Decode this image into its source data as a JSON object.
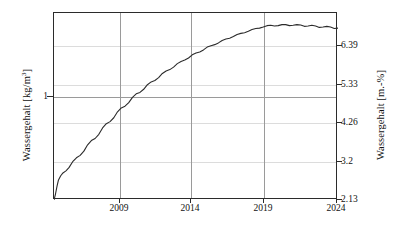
{
  "chart_data": {
    "type": "line",
    "title": "",
    "xlabel": "",
    "ylabel": "Wassergehalt [kg/m3]",
    "ylabel_right": "Wassergehalt [m.-%]",
    "xlim": [
      2005.0,
      2024.0
    ],
    "ylim_left": [
      0.0,
      2.0
    ],
    "ylim_right": [
      2.13,
      7.45
    ],
    "grid": true,
    "legend": null,
    "x_ticks": [
      2009,
      2014,
      2019,
      2024
    ],
    "x_tick_labels": [
      "2009",
      "2014",
      "2019",
      "2024"
    ],
    "y_ticks_left": [
      1
    ],
    "y_tick_labels_left": [
      "1"
    ],
    "y_ticks_right": [
      2.13,
      3.2,
      4.26,
      5.33,
      6.39
    ],
    "y_tick_labels_right": [
      "2.13",
      "3.2",
      "4.26",
      "5.33",
      "6.39"
    ],
    "series": [
      {
        "name": "Wassergehalt",
        "color": "#2b2b2b",
        "x": [
          2005.0,
          2005.1,
          2005.2,
          2005.3,
          2005.45,
          2005.6,
          2005.8,
          2006.0,
          2006.25,
          2006.5,
          2006.75,
          2007.0,
          2007.25,
          2007.5,
          2007.75,
          2008.0,
          2008.25,
          2008.5,
          2008.75,
          2009.0,
          2009.25,
          2009.5,
          2009.75,
          2010.0,
          2010.25,
          2010.5,
          2010.75,
          2011.0,
          2011.25,
          2011.5,
          2011.75,
          2012.0,
          2012.25,
          2012.5,
          2012.75,
          2013.0,
          2013.25,
          2013.5,
          2013.75,
          2014.0,
          2014.25,
          2014.5,
          2014.75,
          2015.0,
          2015.25,
          2015.5,
          2015.75,
          2016.0,
          2016.25,
          2016.5,
          2016.75,
          2017.0,
          2017.25,
          2017.5,
          2017.75,
          2018.0,
          2018.25,
          2018.5,
          2018.75,
          2019.0,
          2019.25,
          2019.5,
          2019.75,
          2020.0,
          2020.25,
          2020.5,
          2020.75,
          2021.0,
          2021.25,
          2021.5,
          2021.75,
          2022.0,
          2022.25,
          2022.5,
          2022.75,
          2023.0,
          2023.25,
          2023.5,
          2023.75,
          2024.0
        ],
        "y": [
          2.13,
          2.3,
          2.52,
          2.7,
          2.82,
          2.9,
          2.96,
          3.05,
          3.22,
          3.33,
          3.4,
          3.52,
          3.7,
          3.82,
          3.88,
          4.0,
          4.18,
          4.3,
          4.36,
          4.47,
          4.64,
          4.75,
          4.8,
          4.9,
          5.05,
          5.15,
          5.19,
          5.28,
          5.41,
          5.49,
          5.53,
          5.61,
          5.73,
          5.8,
          5.84,
          5.91,
          6.01,
          6.07,
          6.11,
          6.17,
          6.26,
          6.31,
          6.34,
          6.4,
          6.48,
          6.52,
          6.55,
          6.6,
          6.67,
          6.71,
          6.73,
          6.78,
          6.84,
          6.87,
          6.89,
          6.93,
          6.98,
          7.01,
          7.02,
          7.05,
          7.09,
          7.1,
          7.08,
          7.09,
          7.12,
          7.12,
          7.09,
          7.1,
          7.12,
          7.11,
          7.07,
          7.08,
          7.1,
          7.08,
          7.04,
          7.05,
          7.07,
          7.05,
          7.01,
          7.02
        ],
        "note": "Monotonic saturation curve with seasonal sawtooth oscillation; plateaus after 2018"
      }
    ]
  },
  "axes": {
    "left": {
      "title_main": "Wassergehalt [kg/m",
      "title_sup": "3",
      "title_tail": "]",
      "ticks": [
        {
          "label": "1",
          "value": 1,
          "y_px": 96
        }
      ]
    },
    "right": {
      "title": "Wassergehalt [m.-%]",
      "ticks": [
        {
          "label": "6.39",
          "value": 6.39,
          "y_px": 45
        },
        {
          "label": "5.33",
          "value": 5.33,
          "y_px": 84
        },
        {
          "label": "4.26",
          "value": 4.26,
          "y_px": 122
        },
        {
          "label": "3.2",
          "value": 3.2,
          "y_px": 161
        },
        {
          "label": "2.13",
          "value": 2.13,
          "y_px": 199
        }
      ]
    },
    "bottom": {
      "ticks": [
        {
          "label": "2009",
          "value": 2009,
          "x_px": 119
        },
        {
          "label": "2014",
          "value": 2014,
          "x_px": 190
        },
        {
          "label": "2019",
          "value": 2019,
          "x_px": 263
        },
        {
          "label": "2024",
          "value": 2024,
          "x_px": 336
        }
      ]
    }
  },
  "colors": {
    "curve": "#2b2b2b",
    "frame": "#2b2b2b",
    "gridline_minor": "#dcdcdc",
    "gridline_major": "#9a9a9a",
    "background": "#ffffff",
    "text": "#111111"
  }
}
